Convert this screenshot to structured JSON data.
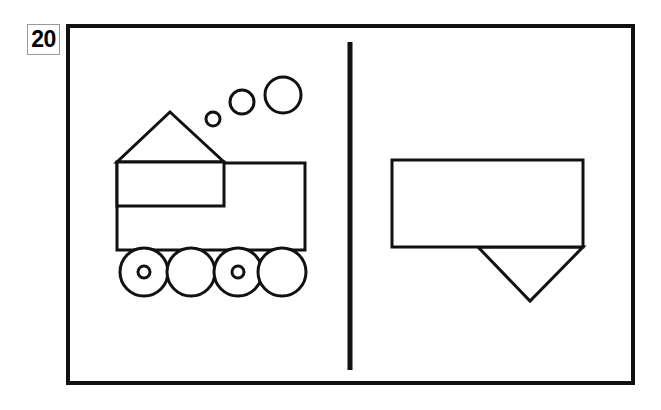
{
  "figure": {
    "number_label": "20",
    "stroke_color": "#111111",
    "fill_color": "#ffffff",
    "background_color": "#ffffff",
    "badge_border_color": "#9a9a9a",
    "frame": {
      "name": "outer-frame",
      "x": 66,
      "y": 24,
      "width": 569,
      "height": 361,
      "stroke_width": 4
    },
    "divider": {
      "name": "vertical-divider",
      "x": 350,
      "y1": 42,
      "y2": 370,
      "stroke_width": 5
    },
    "left_panel": {
      "name": "train-figure",
      "description": "Train drawn from simple shapes",
      "shapes": [
        {
          "name": "train-roof-triangle",
          "type": "triangle",
          "points": "170,112 224,162 117,162",
          "stroke_width": 3
        },
        {
          "name": "train-cab-rectangle",
          "type": "rect",
          "x": 117,
          "y": 162,
          "width": 107,
          "height": 44,
          "stroke_width": 3
        },
        {
          "name": "train-body-rectangle",
          "type": "rect",
          "x": 117,
          "y": 163,
          "width": 188,
          "height": 87,
          "stroke_width": 3
        },
        {
          "name": "train-wheel-1",
          "type": "circle",
          "cx": 144,
          "cy": 272,
          "r": 24,
          "hub_r": 6,
          "stroke_width": 3
        },
        {
          "name": "train-wheel-2",
          "type": "circle",
          "cx": 191,
          "cy": 272,
          "r": 24,
          "hub_r": 0,
          "stroke_width": 3
        },
        {
          "name": "train-wheel-3",
          "type": "circle",
          "cx": 238,
          "cy": 272,
          "r": 24,
          "hub_r": 6,
          "stroke_width": 3
        },
        {
          "name": "train-wheel-4",
          "type": "circle",
          "cx": 282,
          "cy": 272,
          "r": 24,
          "hub_r": 0,
          "stroke_width": 3
        },
        {
          "name": "smoke-puff-small",
          "type": "circle",
          "cx": 213,
          "cy": 119,
          "r": 7,
          "stroke_width": 3
        },
        {
          "name": "smoke-puff-medium",
          "type": "circle",
          "cx": 242,
          "cy": 102,
          "r": 12,
          "stroke_width": 3
        },
        {
          "name": "smoke-puff-large",
          "type": "circle",
          "cx": 283,
          "cy": 95,
          "r": 18,
          "stroke_width": 3
        }
      ]
    },
    "right_panel": {
      "name": "partial-figure",
      "description": "Rectangle with downward pointing triangle below",
      "shapes": [
        {
          "name": "partial-rectangle",
          "type": "rect",
          "x": 392,
          "y": 160,
          "width": 191,
          "height": 87,
          "stroke_width": 3
        },
        {
          "name": "partial-down-triangle",
          "type": "triangle",
          "points": "478,247 583,247 530,301",
          "stroke_width": 3
        }
      ]
    }
  }
}
